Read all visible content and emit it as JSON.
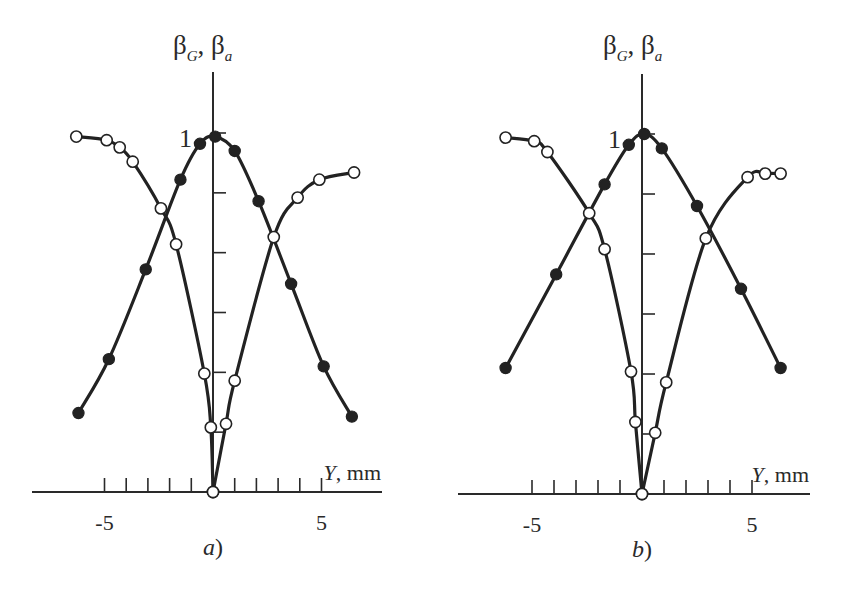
{
  "chart_data": [
    {
      "type": "line",
      "panel_label": "a",
      "panel_suffix": ")",
      "title": "",
      "ylabel_parts": [
        "β",
        "G",
        ", β",
        "a"
      ],
      "xlabel_var": "Y",
      "xlabel_unit": ", mm",
      "xlim": [
        -8.3,
        7.8
      ],
      "ylim": [
        0,
        1
      ],
      "x_ticks": [
        -5,
        -4,
        -3,
        -2,
        -1,
        1,
        2,
        3,
        4,
        5
      ],
      "x_tick_labels": [
        {
          "x": -5,
          "label": "-5"
        },
        {
          "x": 5,
          "label": "5"
        }
      ],
      "y_ticks": [
        0.1667,
        0.3333,
        0.5,
        0.6667,
        0.8333,
        1.0
      ],
      "y_tick_labels": [
        {
          "y": 1,
          "label": "1"
        }
      ],
      "grid": false,
      "series": [
        {
          "name": "filled markers",
          "marker": "filled-circle",
          "x": [
            -6.2,
            -4.8,
            -3.1,
            -1.5,
            -0.6,
            0.1,
            1.0,
            2.1,
            3.6,
            5.1,
            6.4
          ],
          "y": [
            0.22,
            0.37,
            0.62,
            0.87,
            0.97,
            0.99,
            0.95,
            0.81,
            0.58,
            0.35,
            0.21
          ]
        },
        {
          "name": "open markers (left branch)",
          "marker": "open-circle",
          "x": [
            -6.3,
            -4.9,
            -4.3,
            -3.7,
            -2.4,
            -1.7,
            -0.4,
            -0.1,
            0.0
          ],
          "y": [
            0.99,
            0.98,
            0.96,
            0.92,
            0.79,
            0.69,
            0.33,
            0.18,
            0.0
          ]
        },
        {
          "name": "open markers (right branch)",
          "marker": "open-circle",
          "x": [
            0.0,
            0.6,
            1.0,
            2.8,
            3.9,
            4.9,
            6.5
          ],
          "y": [
            0.0,
            0.19,
            0.31,
            0.71,
            0.82,
            0.87,
            0.89
          ]
        }
      ]
    },
    {
      "type": "line",
      "panel_label": "b",
      "panel_suffix": ")",
      "title": "",
      "ylabel_parts": [
        "β",
        "G",
        ", β",
        "a"
      ],
      "xlabel_var": "Y",
      "xlabel_unit": ", mm",
      "xlim": [
        -8.3,
        7.6
      ],
      "ylim": [
        0,
        1
      ],
      "x_ticks": [
        -5,
        -4,
        -3,
        -2,
        -1,
        1,
        2,
        3,
        4,
        5
      ],
      "x_tick_labels": [
        {
          "x": -5,
          "label": "-5"
        },
        {
          "x": 5,
          "label": "5"
        }
      ],
      "y_ticks": [
        0.1667,
        0.3333,
        0.5,
        0.6667,
        0.8333,
        1.0
      ],
      "y_tick_labels": [
        {
          "y": 1,
          "label": "1"
        }
      ],
      "grid": false,
      "series": [
        {
          "name": "filled markers",
          "marker": "filled-circle",
          "x": [
            -6.2,
            -3.9,
            -1.7,
            -0.6,
            0.1,
            0.9,
            2.5,
            4.5,
            6.3
          ],
          "y": [
            0.35,
            0.61,
            0.86,
            0.97,
            1.0,
            0.96,
            0.8,
            0.57,
            0.35
          ]
        },
        {
          "name": "open markers (left branch)",
          "marker": "open-circle",
          "x": [
            -6.2,
            -4.9,
            -4.3,
            -2.4,
            -1.7,
            -0.5,
            -0.3,
            0.0
          ],
          "y": [
            0.99,
            0.98,
            0.95,
            0.78,
            0.68,
            0.34,
            0.2,
            0.0
          ]
        },
        {
          "name": "open markers (right branch)",
          "marker": "open-circle",
          "x": [
            0.0,
            0.6,
            1.1,
            2.9,
            4.8,
            5.6,
            6.3
          ],
          "y": [
            0.0,
            0.17,
            0.31,
            0.71,
            0.88,
            0.89,
            0.89
          ]
        }
      ]
    }
  ]
}
